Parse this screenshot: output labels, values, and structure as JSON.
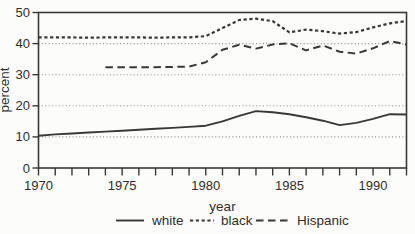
{
  "figure": {
    "background": "#fcfcfa",
    "line_color": "#383838",
    "grid_color": "#8c8c8c",
    "text_color": "#2e2e2e"
  },
  "chart_data": {
    "type": "line",
    "title": "",
    "xlabel": "year",
    "ylabel": "percent",
    "xlim": [
      1970,
      1992
    ],
    "ylim": [
      0,
      50
    ],
    "x_tick_every": 1,
    "x_tick_labels": [
      1970,
      1975,
      1980,
      1985,
      1990
    ],
    "y_ticks": [
      0,
      10,
      20,
      30,
      40,
      50
    ],
    "gridlines_y": [
      10,
      20,
      30,
      40
    ],
    "grid": "dotted-horizontal",
    "legend_position": "bottom-center",
    "series": [
      {
        "name": "white",
        "style": "solid",
        "year_start": 1970,
        "values": [
          10.4,
          10.8,
          11.1,
          11.4,
          11.7,
          12.0,
          12.3,
          12.6,
          12.9,
          13.2,
          13.6,
          15.0,
          16.8,
          18.3,
          17.9,
          17.3,
          16.3,
          15.2,
          13.8,
          14.5,
          15.8,
          17.3,
          17.2
        ]
      },
      {
        "name": "black",
        "style": "dotted",
        "year_start": 1970,
        "values": [
          42.0,
          42.0,
          42.0,
          41.9,
          42.0,
          42.0,
          42.0,
          41.9,
          42.0,
          42.0,
          42.4,
          45.0,
          47.6,
          48.0,
          47.2,
          43.6,
          44.5,
          44.0,
          43.2,
          43.7,
          45.2,
          46.5,
          47.3
        ]
      },
      {
        "name": "Hispanic",
        "style": "dashed",
        "year_start": 1974,
        "values": [
          32.4,
          32.4,
          32.4,
          32.4,
          32.5,
          32.6,
          34.0,
          38.0,
          39.6,
          38.4,
          39.7,
          40.1,
          37.8,
          39.4,
          37.4,
          36.8,
          38.5,
          40.8,
          39.7
        ]
      }
    ]
  }
}
